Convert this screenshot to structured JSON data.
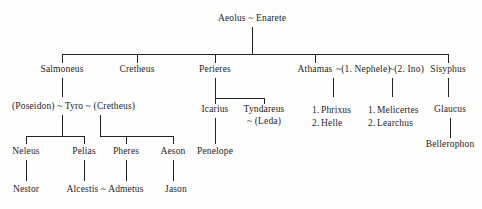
{
  "diagram": {
    "title": "Aeolus ~ Enarete",
    "caption": "Genealogy of the house of Aeolus",
    "ink_color": "#232323",
    "background_color": "#fdfdfc"
  },
  "nodes": {
    "root": "Aeolus ~ Enarete",
    "gen2": {
      "salmoneus": "Salmoneus",
      "cretheus": "Cretheus",
      "perieres": "Perieres",
      "athamas_line": "Athamas ~(1. Nephele)~(2. Ino)",
      "athamas": "Athamas",
      "nephele": "~(1. Nephele)",
      "ino": "~(2. Ino)",
      "sisyphus": "Sisyphus"
    },
    "gen3": {
      "tyro_line": "(Poseidon) ~ Tyro ~ (Cretheus)",
      "icarius": "Icarius",
      "tyndareus": "Tyndareus",
      "leda": "~ (Leda)",
      "nephele_children": [
        {
          "num": "1.",
          "name": "Phrixus"
        },
        {
          "num": "2.",
          "name": "Helle"
        }
      ],
      "ino_children": [
        {
          "num": "1.",
          "name": "Melicertes"
        },
        {
          "num": "2.",
          "name": "Learchus"
        }
      ],
      "glaucus": "Glaucus"
    },
    "gen4": {
      "neleus": "Neleus",
      "pelias": "Pelias",
      "pheres": "Pheres",
      "aeson": "Aeson",
      "penelope": "Penelope",
      "bellerophon": "Bellerophon"
    },
    "gen5": {
      "nestor": "Nestor",
      "alcestis_admetus": "Alcestis ~ Admetus",
      "jason": "Jason"
    }
  }
}
